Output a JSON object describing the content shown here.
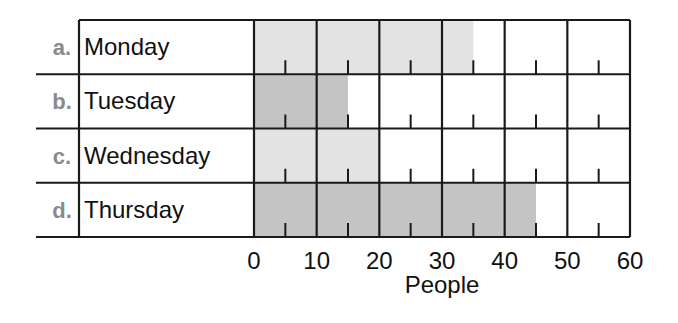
{
  "chart_data": {
    "type": "bar",
    "orientation": "horizontal",
    "title": "",
    "xlabel": "People",
    "ylabel": "",
    "xlim": [
      0,
      60
    ],
    "x_ticks": [
      "0",
      "10",
      "20",
      "30",
      "40",
      "50",
      "60"
    ],
    "minor_tick_interval": 5,
    "grid": true,
    "categories": [
      {
        "letter": "a.",
        "label": "Monday",
        "value": 35,
        "color": "#e3e3e3"
      },
      {
        "letter": "b.",
        "label": "Tuesday",
        "value": 15,
        "color": "#c4c4c4"
      },
      {
        "letter": "c.",
        "label": "Wednesday",
        "value": 20,
        "color": "#e3e3e3"
      },
      {
        "letter": "d.",
        "label": "Thursday",
        "value": 45,
        "color": "#c4c4c4"
      }
    ]
  }
}
